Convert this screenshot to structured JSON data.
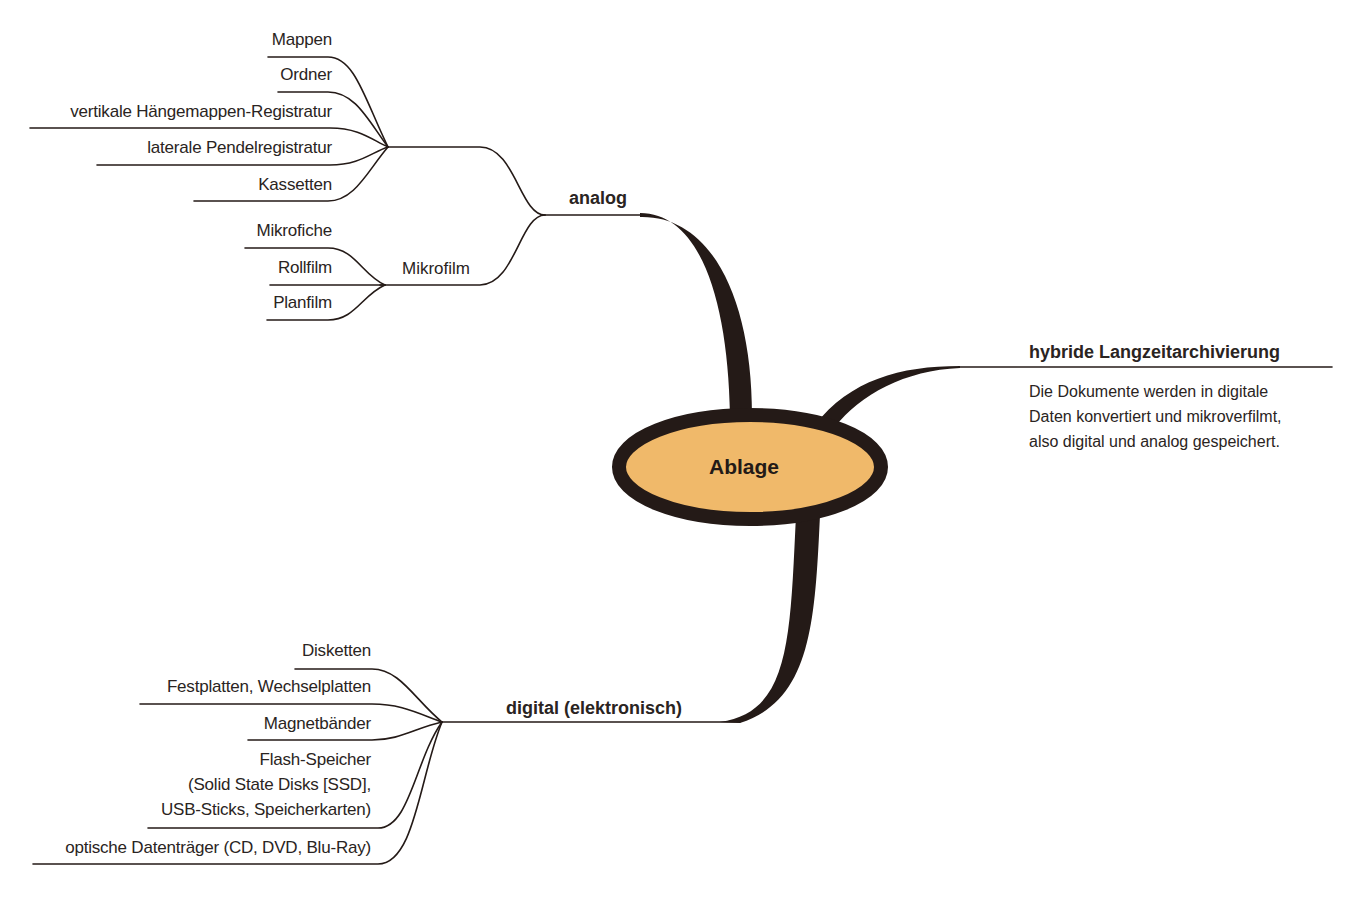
{
  "diagram": {
    "type": "mind-map",
    "colors": {
      "center_fill": "#f0b96a",
      "stroke": "#241a17",
      "text": "#2a2422",
      "background": "#ffffff"
    },
    "center": {
      "label": "Ablage"
    },
    "branches": {
      "analog": {
        "label": "analog",
        "direct_children": [
          "Mappen",
          "Ordner",
          "vertikale Hängemappen-Registratur",
          "laterale Pendelregistratur",
          "Kassetten"
        ],
        "mikrofilm": {
          "label": "Mikrofilm",
          "children": [
            "Mikrofiche",
            "Rollfilm",
            "Planfilm"
          ]
        }
      },
      "digital": {
        "label": "digital (elektronisch)",
        "children": [
          {
            "lines": [
              "Disketten"
            ]
          },
          {
            "lines": [
              "Festplatten, Wechselplatten"
            ]
          },
          {
            "lines": [
              "Magnetbänder"
            ]
          },
          {
            "lines": [
              "Flash-Speicher",
              "(Solid State Disks [SSD],",
              "USB-Sticks, Speicherkarten)"
            ]
          },
          {
            "lines": [
              "optische Datenträger (CD, DVD, Blu-Ray)"
            ]
          }
        ]
      },
      "hybrid": {
        "label": "hybride Langzeitarchivierung",
        "description_lines": [
          "Die Dokumente werden in digitale",
          "Daten konvertiert und mikroverfilmt,",
          "also digital und analog gespeichert."
        ]
      }
    }
  }
}
